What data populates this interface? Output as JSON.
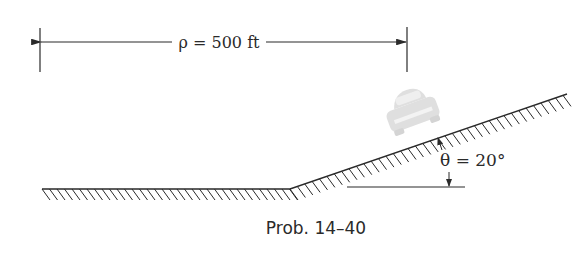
{
  "figure": {
    "dimension_label": "ρ = 500 ft",
    "angle_label": "θ = 20°",
    "caption": "Prob. 14–40",
    "car_icon": "car-icon"
  },
  "colors": {
    "ink": "#2a2a2a",
    "car": "#d8d8d8",
    "background": "#ffffff"
  }
}
